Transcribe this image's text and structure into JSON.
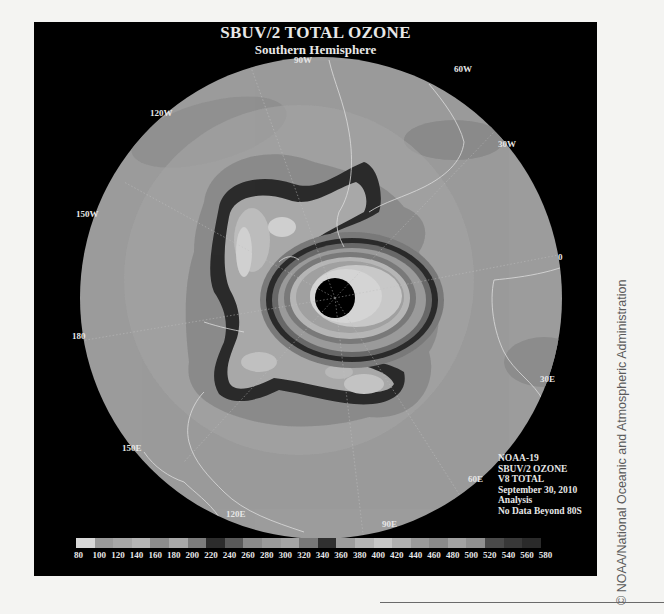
{
  "figure": {
    "title": "SBUV/2 TOTAL OZONE",
    "subtitle": "Southern Hemisphere",
    "longitude_labels": {
      "lon_90w": "90W",
      "lon_60w": "60W",
      "lon_120w": "120W",
      "lon_30w": "30W",
      "lon_150w": "150W",
      "lon_0": "0",
      "lon_180": "180",
      "lon_30e": "30E",
      "lon_150e": "150E",
      "lon_60e": "60E",
      "lon_120e": "120E",
      "lon_90e": "90E"
    },
    "info": {
      "satellite": "NOAA-19",
      "product": "SBUV/2 OZONE",
      "version": "V8 TOTAL",
      "date": "September 30, 2010",
      "type": "Analysis",
      "note": "No Data Beyond 80S"
    },
    "colorbar": {
      "ticks": [
        "80",
        "100",
        "120",
        "140",
        "160",
        "180",
        "200",
        "220",
        "240",
        "260",
        "280",
        "300",
        "320",
        "340",
        "360",
        "380",
        "400",
        "420",
        "440",
        "460",
        "480",
        "500",
        "520",
        "540",
        "560",
        "580"
      ],
      "colors": [
        "#d8d8d8",
        "#9a9a9a",
        "#a6a6a6",
        "#b4b4b4",
        "#8c8c8c",
        "#a8a8a8",
        "#7c7c7c",
        "#2c2c2c",
        "#5a5a5a",
        "#8a8a8a",
        "#9a9a9a",
        "#a4a4a4",
        "#787878",
        "#303030",
        "#9c9c9c",
        "#b4b4b4",
        "#c6c6c6",
        "#b0b0b0",
        "#9a9a9a",
        "#8a8a8a",
        "#a2a2a2",
        "#909090",
        "#4a4a4a",
        "#383838",
        "#2a2a2a"
      ]
    },
    "colors": {
      "frame": "#000000",
      "globe_base": "#9a9a9a",
      "coastline": "#e0e0e0"
    }
  },
  "credit": "© NOAA/National Oceanic and Atmospheric Administration"
}
